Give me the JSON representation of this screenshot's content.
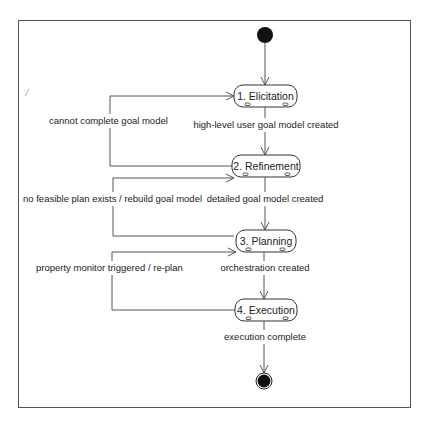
{
  "diagram": {
    "type": "UML state machine",
    "colors": {
      "line": "#555555",
      "node_fill": "#111111",
      "background": "#ffffff"
    },
    "initial_node": "initial-state",
    "final_node": "final-state",
    "states": [
      {
        "id": "s1",
        "label": "1. Elicitation"
      },
      {
        "id": "s2",
        "label": "2. Refinement"
      },
      {
        "id": "s3",
        "label": "3. Planning"
      },
      {
        "id": "s4",
        "label": "4. Execution"
      }
    ],
    "transitions": [
      {
        "from": "initial",
        "to": "s1",
        "label": ""
      },
      {
        "from": "s1",
        "to": "s2",
        "label": "high-level user goal model created"
      },
      {
        "from": "s2",
        "to": "s1",
        "label": "cannot complete goal model"
      },
      {
        "from": "s2",
        "to": "s3",
        "label": "detailed goal model created"
      },
      {
        "from": "s3",
        "to": "s2",
        "label": "no feasible plan exists / rebuild goal model"
      },
      {
        "from": "s3",
        "to": "s4",
        "label": "orchestration created"
      },
      {
        "from": "s4",
        "to": "s3",
        "label": "property monitor triggered / re-plan"
      },
      {
        "from": "s4",
        "to": "final",
        "label": "execution complete"
      }
    ]
  }
}
